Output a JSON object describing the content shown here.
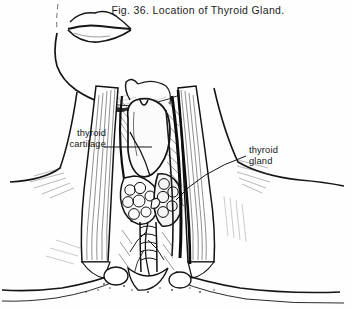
{
  "figure": {
    "caption": "Fig. 36.   Location of Thyroid Gland.",
    "number": "Fig. 36.",
    "title": "Location of Thyroid Gland.",
    "style": "black-and-white line engraving with cross-hatched shading",
    "background_color": "#fefefe",
    "ink_color": "#111111"
  },
  "annotations": [
    {
      "id": "thyroid-cartilage",
      "line1": "thyroid",
      "line2": "cartilage",
      "text": "thyroid cartilage",
      "side": "left",
      "leader": "horizontal line running right from the label to the thyroid cartilage prominence"
    },
    {
      "id": "thyroid-gland",
      "line1": "thyroid",
      "line2": "gland",
      "text": "thyroid gland",
      "side": "right",
      "leader": "long diagonal line running down-left from the label to the thyroid gland lobe"
    }
  ],
  "depicted_structures": [
    "lips",
    "chin",
    "mandible",
    "neck",
    "sternocleidomastoid muscle (left)",
    "sternocleidomastoid muscle (right)",
    "thyroid cartilage",
    "thyroid gland",
    "trachea",
    "strap muscles",
    "jugular vein",
    "clavicle (left)",
    "clavicle (right)",
    "sternal notch",
    "shoulder"
  ]
}
